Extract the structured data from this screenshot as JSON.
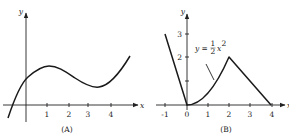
{
  "panels": [
    {
      "id": "A",
      "caption": "(A)",
      "x_axis_label": "x",
      "y_axis_label": "y",
      "x_ticks": [
        "1",
        "2",
        "3",
        "4"
      ],
      "y_ticks": [],
      "description": "Smooth cubic-like curve: rises from below x-axis left of origin, crosses y-axis above x-axis, local max near x=1, local min near x=3.5, increases afterward"
    },
    {
      "id": "B",
      "caption": "(B)",
      "x_axis_label": "x",
      "y_axis_label": "y",
      "x_ticks": [
        "-1",
        "0",
        "1",
        "2",
        "3",
        "4"
      ],
      "y_ticks": [
        "1",
        "2",
        "3"
      ],
      "y_tick_labels_shown": [
        "2",
        "3"
      ],
      "annotation": {
        "prefix": "y = ",
        "frac_num": "1",
        "frac_den": "2",
        "suffix": "x",
        "exp": "2"
      },
      "segments": [
        {
          "type": "line",
          "from": [
            -1,
            3
          ],
          "to": [
            0,
            0
          ]
        },
        {
          "type": "curve",
          "expr": "y = 1/2 x^2",
          "from": [
            0,
            0
          ],
          "to": [
            2,
            2
          ]
        },
        {
          "type": "line",
          "from": [
            2,
            2
          ],
          "to": [
            4,
            0
          ]
        }
      ]
    }
  ]
}
